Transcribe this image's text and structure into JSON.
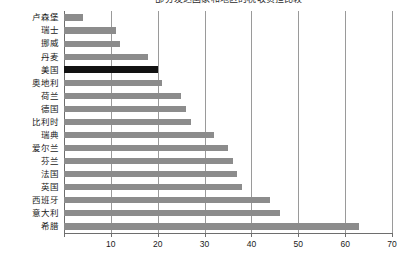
{
  "chart_data": {
    "type": "bar",
    "orientation": "horizontal",
    "title": "部分发达国家和地区的税收负担比较",
    "xlabel": "",
    "ylabel": "",
    "xlim": [
      0,
      70
    ],
    "xticks": [
      0,
      10,
      20,
      30,
      40,
      50,
      60,
      70
    ],
    "xtick_labels": [
      "",
      "10",
      "20",
      "30",
      "40",
      "50",
      "60",
      "70"
    ],
    "grid": true,
    "legend": false,
    "categories": [
      "卢森堡",
      "瑞士",
      "挪威",
      "丹麦",
      "美国",
      "奥地利",
      "荷兰",
      "德国",
      "比利时",
      "瑞典",
      "爱尔兰",
      "芬兰",
      "法国",
      "英国",
      "西班牙",
      "意大利",
      "希腊"
    ],
    "values": [
      4,
      11,
      12,
      18,
      20,
      21,
      25,
      26,
      27,
      32,
      35,
      36,
      37,
      38,
      44,
      46,
      63
    ],
    "highlight_category": "美国",
    "colors": {
      "bar": "#8c8c8c",
      "highlight_bar": "#121212",
      "grid": "#9a9a9a",
      "axis": "#6e6e6e",
      "text": "#1a1a1a",
      "background": "#ffffff"
    }
  }
}
